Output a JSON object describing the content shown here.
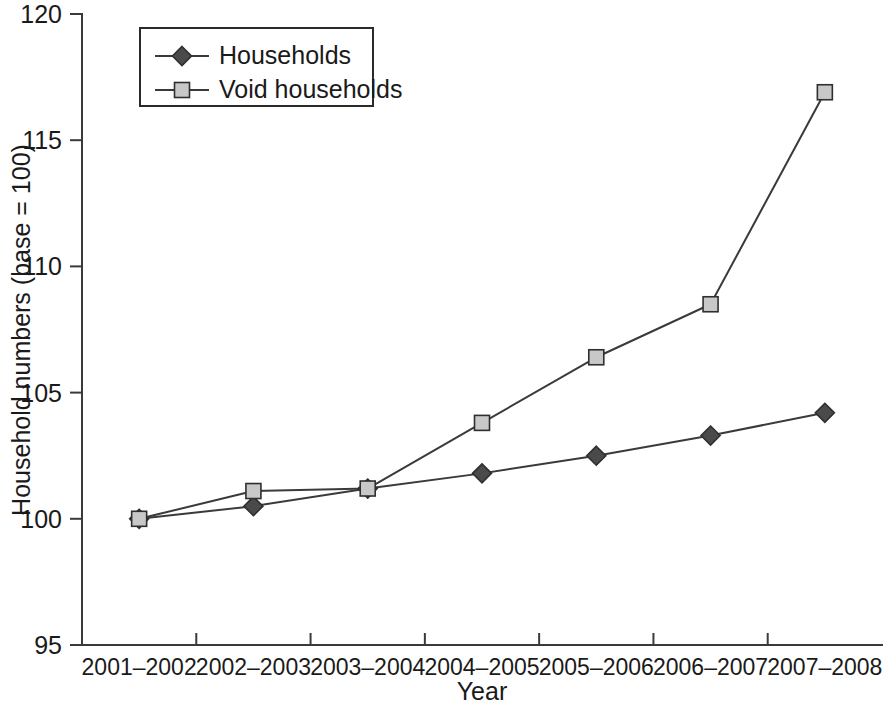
{
  "chart_data": {
    "type": "line",
    "title": "",
    "xlabel": "Year",
    "ylabel": "Household numbers (base = 100)",
    "categories": [
      "2001–2002",
      "2002–2003",
      "2003–2004",
      "2004–2005",
      "2005–2006",
      "2006–2007",
      "2007–2008"
    ],
    "series": [
      {
        "name": "Households",
        "marker": "diamond",
        "marker_fill": "#4a4a4a",
        "marker_stroke": "#2f2f2f",
        "line_color": "#3a3a3a",
        "values": [
          100.0,
          100.5,
          101.2,
          101.8,
          102.5,
          103.3,
          104.2
        ]
      },
      {
        "name": "Void households",
        "marker": "square",
        "marker_fill": "#c8c8c8",
        "marker_stroke": "#2f2f2f",
        "line_color": "#3a3a3a",
        "values": [
          100.0,
          101.1,
          101.2,
          103.8,
          106.4,
          108.5,
          116.9
        ]
      }
    ],
    "ylim": [
      95,
      120
    ],
    "yticks": [
      95,
      100,
      105,
      110,
      115,
      120
    ],
    "ytick_labels": [
      "95",
      "100",
      "105",
      "110",
      "115",
      "120"
    ],
    "grid": false,
    "legend_position": "top-left"
  },
  "legend": {
    "entries": [
      {
        "label": "Households"
      },
      {
        "label": "Void households"
      }
    ]
  }
}
